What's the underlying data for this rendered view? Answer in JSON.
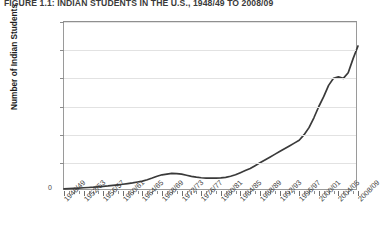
{
  "figure": {
    "title": "Figure 1.1: Indian Students in the U.S., 1948/49 to 2008/09",
    "zero_label": "0"
  },
  "chart_data": {
    "type": "line",
    "title": "Figure 1.1: Indian Students in the U.S., 1948/49 to 2008/09",
    "xlabel": "",
    "ylabel": "Number of Indian Students",
    "ylim": [
      0,
      120000
    ],
    "grid": true,
    "legend": "none",
    "y_tick_labels": [
      "20,000",
      "4,000",
      "60,000",
      "80,000",
      "100,000",
      "120,000"
    ],
    "y_tick_values": [
      20000,
      40000,
      60000,
      80000,
      100000,
      120000
    ],
    "x_tick_labels": [
      "1948/49",
      "1952/53",
      "1956/57",
      "1960/61",
      "1964/65",
      "1968/69",
      "1972/73",
      "1976/77",
      "1980/81",
      "1984/85",
      "1988/89",
      "1992/93",
      "1996/97",
      "2000/01",
      "2004/05",
      "2008/09"
    ],
    "x_minor_tick_step_years": 1,
    "series": [
      {
        "name": "Indian students in the U.S.",
        "color": "#3a3a3a",
        "x": [
          "1948/49",
          "1949/50",
          "1950/51",
          "1951/52",
          "1952/53",
          "1953/54",
          "1954/55",
          "1955/56",
          "1956/57",
          "1957/58",
          "1958/59",
          "1959/60",
          "1960/61",
          "1961/62",
          "1962/63",
          "1963/64",
          "1964/65",
          "1965/66",
          "1966/67",
          "1967/68",
          "1968/69",
          "1969/70",
          "1970/71",
          "1971/72",
          "1972/73",
          "1973/74",
          "1974/75",
          "1975/76",
          "1976/77",
          "1977/78",
          "1978/79",
          "1979/80",
          "1980/81",
          "1981/82",
          "1982/83",
          "1983/84",
          "1984/85",
          "1985/86",
          "1986/87",
          "1987/88",
          "1988/89",
          "1989/90",
          "1990/91",
          "1991/92",
          "1992/93",
          "1993/94",
          "1994/95",
          "1995/96",
          "1996/97",
          "1997/98",
          "1998/99",
          "1999/00",
          "2000/01",
          "2001/02",
          "2002/03",
          "2003/04",
          "2004/05",
          "2005/06",
          "2006/07",
          "2007/08",
          "2008/09"
        ],
        "values": [
          1500,
          1700,
          1900,
          2100,
          2300,
          2500,
          2700,
          3000,
          3300,
          3600,
          4000,
          4400,
          4800,
          5300,
          5800,
          6400,
          7000,
          8000,
          9200,
          10500,
          11500,
          12000,
          12500,
          12400,
          12000,
          11200,
          10400,
          9800,
          9400,
          9200,
          9100,
          9200,
          9300,
          9700,
          10500,
          11500,
          13000,
          14500,
          16000,
          18000,
          20000,
          22000,
          24000,
          26000,
          28000,
          30000,
          32000,
          34000,
          36000,
          40000,
          45000,
          52000,
          60000,
          67000,
          75000,
          80000,
          81000,
          80000,
          84000,
          94000,
          103000
        ]
      }
    ]
  }
}
